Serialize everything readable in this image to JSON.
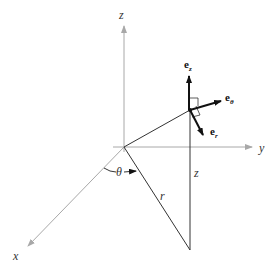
{
  "diagram": {
    "axes": {
      "x": {
        "label": "x"
      },
      "y": {
        "label": "y"
      },
      "z": {
        "label": "z"
      }
    },
    "labels": {
      "theta": "θ",
      "r": "r",
      "z_height": "z"
    },
    "unit_vectors": [
      {
        "name": "e_z",
        "base": "e",
        "subscript": "z"
      },
      {
        "name": "e_theta",
        "base": "e",
        "subscript": "θ"
      },
      {
        "name": "e_r",
        "base": "e",
        "subscript": "r"
      }
    ],
    "colors": {
      "axis": "#a8a8a8",
      "line": "#333333",
      "vector": "#111111",
      "background": "#ffffff"
    }
  }
}
